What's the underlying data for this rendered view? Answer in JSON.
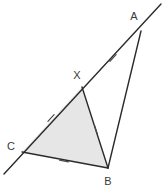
{
  "figure": {
    "canvas": {
      "width": 162,
      "height": 191,
      "background": "#ffffff"
    },
    "style": {
      "stroke_color": "#2b2b2b",
      "stroke_width": 1.4,
      "tick_stroke_width": 1.2,
      "fill_color": "#e6e6e6",
      "label_color": "#3a3a3a",
      "label_font_size": 11
    },
    "points": [
      {
        "name": "A",
        "label": "A",
        "x": 141,
        "y": 31,
        "label_x": 134,
        "label_y": 17
      },
      {
        "name": "X",
        "label": "X",
        "x": 82,
        "y": 87,
        "label_x": 77,
        "label_y": 76
      },
      {
        "name": "C",
        "label": "C",
        "x": 22,
        "y": 152,
        "label_x": 11,
        "label_y": 147
      },
      {
        "name": "B",
        "label": "B",
        "x": 108,
        "y": 168,
        "label_x": 108,
        "label_y": 182
      }
    ],
    "lines": [
      {
        "name": "line-CA-extended",
        "from": {
          "x": 4,
          "y": 174
        },
        "to": {
          "x": 161,
          "y": 4
        },
        "description": "full line through C, X and A, extended past both ends"
      }
    ],
    "segments": [
      {
        "name": "segment-XB",
        "from": "X",
        "to": "B",
        "x1": 82,
        "y1": 87,
        "x2": 108,
        "y2": 168
      },
      {
        "name": "segment-CB",
        "from": "C",
        "to": "B",
        "x1": 22,
        "y1": 152,
        "x2": 108,
        "y2": 168
      },
      {
        "name": "segment-AB",
        "from": "A",
        "to": "B",
        "x1": 141,
        "y1": 31,
        "x2": 108,
        "y2": 168
      }
    ],
    "shaded_region": {
      "name": "triangle-CXB",
      "vertices": [
        "C",
        "X",
        "B"
      ],
      "polygon": "22,152 82,87 108,168"
    },
    "tick_marks": [
      {
        "name": "tick-on-XA",
        "on_segment": "XA",
        "x": 113,
        "y": 58,
        "angle_deg": -47,
        "count": 1
      },
      {
        "name": "tick-on-CX",
        "on_segment": "CX",
        "x": 51,
        "y": 118,
        "angle_deg": -47,
        "count": 1
      },
      {
        "name": "tick-on-XB",
        "on_segment": "XB",
        "x": 96,
        "y": 130,
        "angle_deg": 72,
        "count": 1
      },
      {
        "name": "tick-on-CB",
        "on_segment": "CB",
        "x": 64,
        "y": 161,
        "angle_deg": 11,
        "count": 1
      }
    ]
  }
}
